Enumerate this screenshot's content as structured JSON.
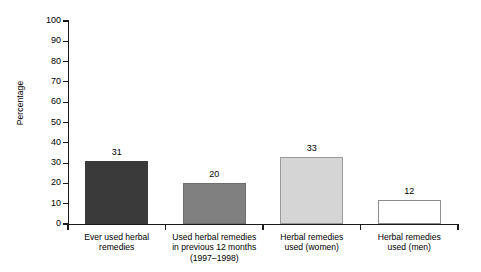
{
  "chart_data": {
    "type": "bar",
    "title": "",
    "subtitle": "",
    "xlabel": "",
    "ylabel": "Percentage",
    "ylim": [
      0,
      100
    ],
    "yticks": [
      0,
      10,
      20,
      30,
      40,
      50,
      60,
      70,
      80,
      90,
      100
    ],
    "ytick_labels": [
      "0",
      "10",
      "20",
      "30",
      "40",
      "50",
      "60",
      "70",
      "80",
      "90",
      "100"
    ],
    "grid": false,
    "legend": "none",
    "categories": [
      "Ever used herbal\nremedies",
      "Used herbal remedies\nin previous 12 months\n(1997–1998)",
      "Herbal remedies\nused (women)",
      "Herbal remedies\nused (men)"
    ],
    "values": [
      31,
      20,
      33,
      12
    ],
    "value_labels": [
      "31",
      "20",
      "33",
      "12"
    ],
    "bar_colors": [
      "#3a3a3a",
      "#808080",
      "#d5d5d5",
      "#ffffff"
    ],
    "bar_edge_colors": [
      "#3a3a3a",
      "#6e6e6e",
      "#9a9a9a",
      "#8c8c8c"
    ]
  },
  "axis": {
    "y_title": "Percentage"
  }
}
